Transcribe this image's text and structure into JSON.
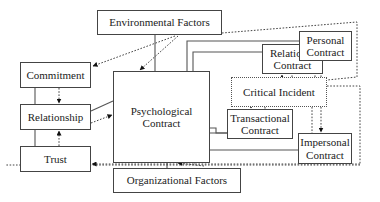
{
  "diagram": {
    "nodes": {
      "environmental": {
        "label": "Environmental Factors"
      },
      "commitment": {
        "label": "Commitment"
      },
      "relationship": {
        "label": "Relationship"
      },
      "trust": {
        "label": "Trust"
      },
      "psychological": {
        "line1": "Psychological",
        "line2": "Contract"
      },
      "relational": {
        "line1": "Relational",
        "line2": "Contract"
      },
      "personal": {
        "line1": "Personal",
        "line2": "Contract"
      },
      "critical": {
        "label": "Critical Incident"
      },
      "transactional": {
        "line1": "Transactional",
        "line2": "Contract"
      },
      "impersonal": {
        "line1": "Impersonal",
        "line2": "Contract"
      },
      "organizational": {
        "label": "Organizational Factors"
      }
    },
    "edges": [
      {
        "from": "Environmental Factors",
        "to": "Psychological Contract",
        "style": "solid"
      },
      {
        "from": "Environmental Factors",
        "to": "Psychological Contract",
        "style": "dotted-arrow"
      },
      {
        "from": "Environmental Factors",
        "to": "Commitment",
        "style": "dotted-arrow"
      },
      {
        "from": "Environmental Factors",
        "to": "Critical Incident",
        "style": "dotted"
      },
      {
        "from": "Commitment",
        "to": "Relationship",
        "style": "dotted-arrow"
      },
      {
        "from": "Trust",
        "to": "Relationship",
        "style": "dotted-arrow"
      },
      {
        "from": "Commitment",
        "to": "Trust",
        "style": "solid"
      },
      {
        "from": "Relationship",
        "to": "Psychological Contract",
        "style": "solid"
      },
      {
        "from": "Relationship",
        "to": "Psychological Contract",
        "style": "dotted-arrow"
      },
      {
        "from": "Psychological Contract",
        "to": "Personal Contract",
        "style": "solid"
      },
      {
        "from": "Psychological Contract",
        "to": "Relational Contract",
        "style": "solid"
      },
      {
        "from": "Psychological Contract",
        "to": "Transactional Contract",
        "style": "solid"
      },
      {
        "from": "Psychological Contract",
        "to": "Impersonal Contract",
        "style": "solid"
      },
      {
        "from": "Critical Incident",
        "to": "Relational Contract",
        "style": "dotted-arrow"
      },
      {
        "from": "Critical Incident",
        "to": "Personal Contract",
        "style": "dotted-arrow"
      },
      {
        "from": "Critical Incident",
        "to": "Transactional Contract",
        "style": "dotted-arrow"
      },
      {
        "from": "Critical Incident",
        "to": "Impersonal Contract",
        "style": "dotted-arrow"
      },
      {
        "from": "Critical Incident",
        "to": "Trust",
        "style": "dotted-arrow"
      },
      {
        "from": "Critical Incident",
        "to": "Psychological Contract",
        "style": "dotted-arrow"
      },
      {
        "from": "Organizational Factors",
        "to": "Psychological Contract",
        "style": "solid"
      }
    ]
  }
}
